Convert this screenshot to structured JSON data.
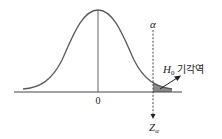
{
  "diagram": {
    "type": "normal-distribution-rejection-region",
    "center_label": "0",
    "alpha_label": "α",
    "critical_value_label": "Z",
    "critical_value_subscript": "α",
    "region_label_main": "H",
    "region_label_subscript": "0",
    "region_label_text": "기각역",
    "colors": {
      "curve": "#5a5a5a",
      "axis": "#444444",
      "shade": "#8a8a8a",
      "text": "#222222"
    }
  }
}
